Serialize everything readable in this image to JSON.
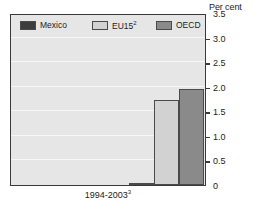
{
  "chart_data": {
    "type": "bar",
    "title": "",
    "xlabel": "1994-2003",
    "xlabel_superscript": "3",
    "ylabel": "Per cent",
    "ylim": [
      0,
      3.5
    ],
    "ytick_labels": [
      "3.5",
      "3.0",
      "2.5",
      "2.0",
      "1.5",
      "1.0",
      "0.5",
      "0"
    ],
    "ytick_values": [
      3.5,
      3.0,
      2.5,
      2.0,
      1.5,
      1.0,
      0.5,
      0
    ],
    "grid": true,
    "legend_position": "top-inside",
    "categories": [
      "1994-2003"
    ],
    "series": [
      {
        "name": "Mexico",
        "values": [
          0.05
        ],
        "color": "#3d3d3d"
      },
      {
        "name": "EU15",
        "values": [
          1.72
        ],
        "color": "#d2d2d2",
        "superscript": "2"
      },
      {
        "name": "OECD",
        "values": [
          1.95
        ],
        "color": "#8a8a8a"
      }
    ]
  },
  "legend": {
    "entries": [
      {
        "label": "Mexico",
        "sup": ""
      },
      {
        "label": "EU15",
        "sup": "2"
      },
      {
        "label": "OECD",
        "sup": ""
      }
    ]
  },
  "axis": {
    "unit_caption": "Per cent"
  },
  "colors": {
    "plot_background": "#e6e6e6",
    "frame": "#3a3a3a",
    "gridline": "#f7f7f7",
    "mexico": "#3d3d3d",
    "eu15": "#d2d2d2",
    "oecd": "#8a8a8a"
  }
}
